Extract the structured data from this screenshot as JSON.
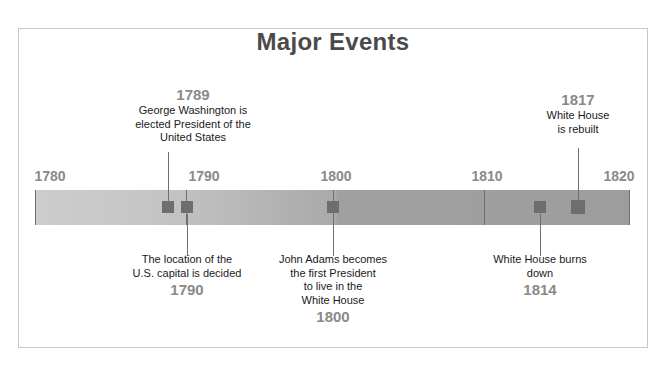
{
  "title": "Major Events",
  "axis": {
    "ticks": [
      "1780",
      "1790",
      "1800",
      "1810",
      "1820"
    ]
  },
  "events": [
    {
      "id": "george-washington-elected",
      "year": "1789",
      "year_position": "above",
      "lines": [
        "George Washington is",
        "elected President of the",
        "United States"
      ]
    },
    {
      "id": "us-capital-decided",
      "year": "1790",
      "year_position": "below",
      "lines": [
        "The location of the",
        "U.S. capital is decided"
      ]
    },
    {
      "id": "john-adams-white-house",
      "year": "1800",
      "year_position": "below",
      "lines": [
        "John Adams becomes",
        "the first President",
        "to live in the",
        "White House"
      ]
    },
    {
      "id": "white-house-burns-down",
      "year": "1814",
      "year_position": "below",
      "lines": [
        "White House burns",
        "down"
      ]
    },
    {
      "id": "white-house-rebuilt",
      "year": "1817",
      "year_position": "above",
      "lines": [
        "White House",
        "is rebuilt"
      ]
    }
  ],
  "colors": {
    "title": "#4a4a4a",
    "year_label": "#8a8a8a",
    "body_text": "#1a1a1a",
    "marker": "#6e6e6e",
    "bar_light": "#cdcdcd",
    "bar_dark": "#9d9d9d",
    "frame": "#c9c9c9"
  }
}
